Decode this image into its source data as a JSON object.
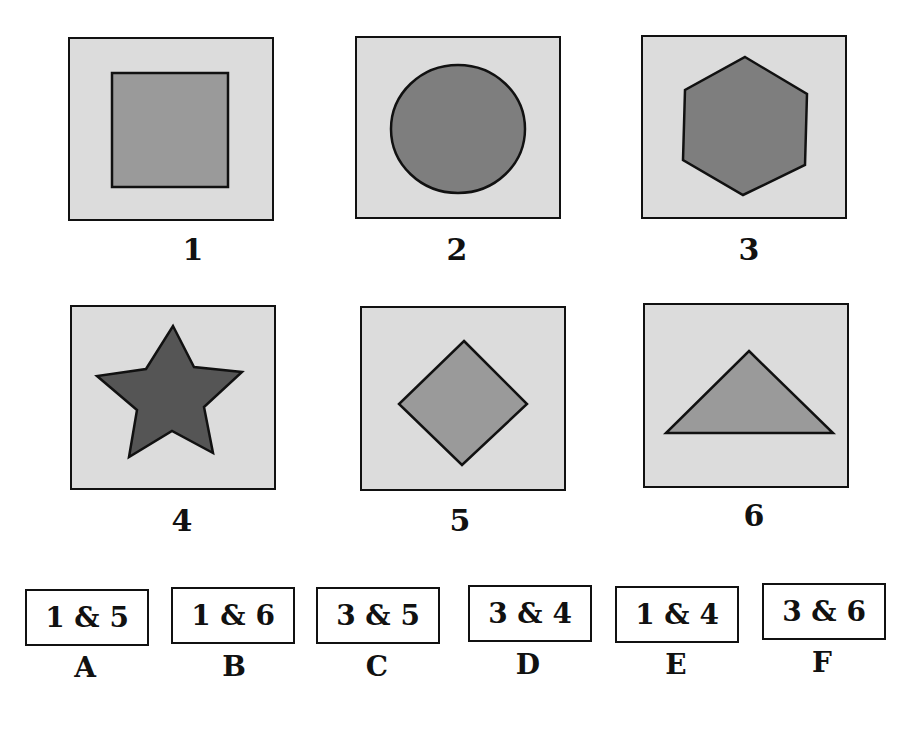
{
  "colors": {
    "panel_bg": "#dcdcdc",
    "shape_light": "#9a9a9a",
    "shape_mid": "#7e7e7e",
    "shape_dark": "#555555",
    "outline": "#111111"
  },
  "figures": [
    {
      "label": "1",
      "shape": "square"
    },
    {
      "label": "2",
      "shape": "circle"
    },
    {
      "label": "3",
      "shape": "hexagon"
    },
    {
      "label": "4",
      "shape": "star"
    },
    {
      "label": "5",
      "shape": "diamond"
    },
    {
      "label": "6",
      "shape": "triangle"
    }
  ],
  "options": [
    {
      "letter": "A",
      "text": "1 & 5"
    },
    {
      "letter": "B",
      "text": "1 & 6"
    },
    {
      "letter": "C",
      "text": "3 & 5"
    },
    {
      "letter": "D",
      "text": "3 & 4"
    },
    {
      "letter": "E",
      "text": "1 & 4"
    },
    {
      "letter": "F",
      "text": "3 & 6"
    }
  ]
}
